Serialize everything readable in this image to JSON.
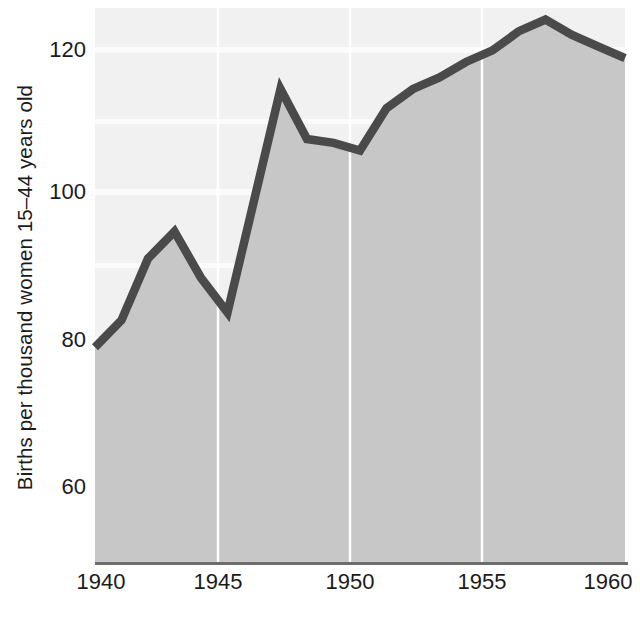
{
  "chart_data": {
    "type": "area",
    "title": "",
    "xlabel": "",
    "ylabel": "Births per thousand women 15–44 years old",
    "x": [
      1940,
      1941,
      1942,
      1943,
      1944,
      1945,
      1946,
      1947,
      1948,
      1949,
      1950,
      1951,
      1952,
      1953,
      1954,
      1955,
      1956,
      1957,
      1958,
      1959,
      1960
    ],
    "values": [
      80.0,
      83.5,
      91.5,
      95.0,
      89.0,
      84.5,
      99.0,
      113.5,
      107.0,
      106.5,
      105.5,
      111.0,
      113.5,
      115.0,
      117.0,
      118.5,
      121.0,
      122.5,
      120.5,
      119.0,
      117.5
    ],
    "xlim": [
      1940,
      1960
    ],
    "ylim": [
      52,
      124
    ],
    "xticks": [
      1940,
      1945,
      1950,
      1955,
      1960
    ],
    "xtick_labels": [
      "1940",
      "1945",
      "1950",
      "1955",
      "1960"
    ],
    "yticks": [
      60,
      80,
      100,
      120
    ],
    "ytick_labels": [
      "60",
      "80",
      "100",
      "120"
    ],
    "grid": "horizontal bands and vertical lines at x ticks",
    "legend": "none",
    "series": [
      {
        "name": "Births per thousand women 15-44 years old",
        "values": [
          80.0,
          83.5,
          91.5,
          95.0,
          89.0,
          84.5,
          99.0,
          113.5,
          107.0,
          106.5,
          105.5,
          111.0,
          113.5,
          115.0,
          117.0,
          118.5,
          121.0,
          122.5,
          120.5,
          119.0,
          117.5
        ]
      }
    ]
  },
  "colors": {
    "line": "#4a4a4a",
    "area_fill": "#c9c9c9",
    "plot_background": "#f2f2f2",
    "gridline": "#ffffff",
    "axis": "#6a6a6a",
    "text": "#1b1b1b"
  }
}
